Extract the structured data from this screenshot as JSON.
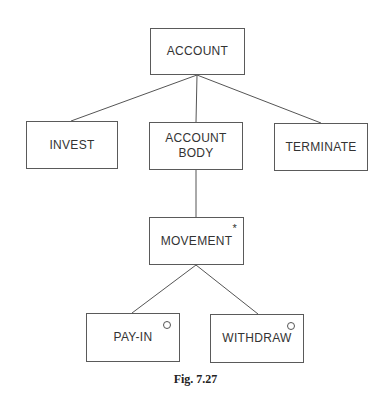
{
  "diagram": {
    "type": "Jackson structure diagram",
    "nodes": [
      {
        "id": "account",
        "label": "ACCOUNT",
        "marker": ""
      },
      {
        "id": "invest",
        "label": "INVEST",
        "marker": ""
      },
      {
        "id": "account_body",
        "label": "ACCOUNT\nBODY",
        "marker": ""
      },
      {
        "id": "terminate",
        "label": "TERMINATE",
        "marker": ""
      },
      {
        "id": "movement",
        "label": "MOVEMENT",
        "marker": "*"
      },
      {
        "id": "pay_in",
        "label": "PAY-IN",
        "marker": "o"
      },
      {
        "id": "withdraw",
        "label": "WITHDRAW",
        "marker": "o"
      }
    ],
    "edges": [
      {
        "from": "account",
        "to": "invest"
      },
      {
        "from": "account",
        "to": "account_body"
      },
      {
        "from": "account",
        "to": "terminate"
      },
      {
        "from": "account_body",
        "to": "movement"
      },
      {
        "from": "movement",
        "to": "pay_in"
      },
      {
        "from": "movement",
        "to": "withdraw"
      }
    ],
    "labels": {
      "account": "ACCOUNT",
      "invest": "INVEST",
      "account_body_line1": "ACCOUNT",
      "account_body_line2": "BODY",
      "terminate": "TERMINATE",
      "movement": "MOVEMENT",
      "movement_marker": "*",
      "pay_in": "PAY-IN",
      "withdraw": "WITHDRAW"
    },
    "caption": "Fig. 7.27"
  }
}
